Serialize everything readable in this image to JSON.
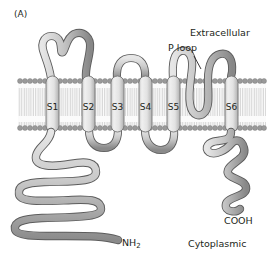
{
  "figure": {
    "panel_label": "(A)",
    "title_alt": "Voltage-gated ion channel membrane topology",
    "annotations": {
      "extracellular": "Extracellular",
      "p_loop": "P loop",
      "n_terminus": "NH",
      "n_terminus_sub": "2",
      "c_terminus": "COOH",
      "cytoplasmic": "Cytoplasmic"
    },
    "segments": [
      {
        "label": "S1"
      },
      {
        "label": "S2"
      },
      {
        "label": "S3"
      },
      {
        "label": "S4"
      },
      {
        "label": "S5"
      },
      {
        "label": "S6"
      }
    ],
    "colors": {
      "text": "#231f20",
      "background": "#ffffff",
      "chain_dark": "#808080",
      "chain_light": "#d9d9d9",
      "chain_outline": "#4d4d4d",
      "membrane_head": "#999999",
      "membrane_tail": "#e8e8e8",
      "membrane_fill": "#f2f2f2",
      "helix_fill": "#e0e0e0",
      "helix_outline": "#6e6e6e"
    },
    "membrane": {
      "top_y": 79,
      "bottom_y": 130
    }
  }
}
